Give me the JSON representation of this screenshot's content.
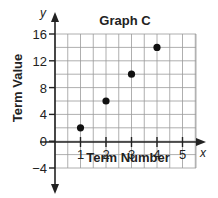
{
  "chart_data": {
    "type": "scatter",
    "title": "Graph C",
    "xlabel": "Term Number",
    "ylabel": "Term Value",
    "x_axis_var": "x",
    "y_axis_var": "y",
    "x": [
      1,
      2,
      3,
      4
    ],
    "values": [
      2,
      6,
      10,
      14
    ],
    "xlim": [
      0,
      5.5
    ],
    "ylim": [
      -4,
      16
    ],
    "x_ticks": [
      "1",
      "2",
      "3",
      "4",
      "5"
    ],
    "y_ticks": [
      "16",
      "12",
      "8",
      "4",
      "0",
      "-4"
    ],
    "grid": true,
    "grid_x_step": 0.5,
    "grid_y_step": 2,
    "legend": null
  },
  "colors": {
    "ink": "#222222",
    "grid": "#9a9a9a",
    "point": "#111111"
  }
}
